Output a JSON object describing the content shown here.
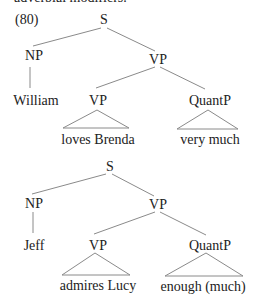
{
  "header_cut_text": "adverbial modifiers.",
  "example_number": "(80)",
  "colors": {
    "text": "#222222",
    "lines": "#8a8a8a",
    "background": "#ffffff"
  },
  "trees": [
    {
      "root": "S",
      "subject": {
        "label": "NP",
        "leaf": "William"
      },
      "predicate": {
        "label": "VP",
        "children": [
          {
            "label": "VP",
            "triangle_leaf": "loves Brenda"
          },
          {
            "label": "QuantP",
            "triangle_leaf": "very much"
          }
        ]
      }
    },
    {
      "root": "S",
      "subject": {
        "label": "NP",
        "leaf": "Jeff"
      },
      "predicate": {
        "label": "VP",
        "children": [
          {
            "label": "VP",
            "triangle_leaf": "admires Lucy"
          },
          {
            "label": "QuantP",
            "triangle_leaf": "enough (much)"
          }
        ]
      }
    }
  ]
}
